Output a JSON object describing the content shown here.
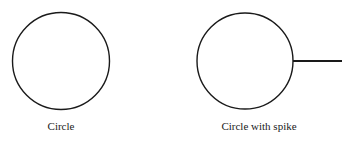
{
  "figures": [
    {
      "label": "Circle",
      "shape": "circle",
      "center": [
        61,
        61
      ],
      "radius": 48.5
    },
    {
      "label": "Circle with spike",
      "shape": "circle-with-spike",
      "center": [
        245,
        61
      ],
      "radius": 48,
      "spike": {
        "x1": 293,
        "y1": 61,
        "x2": 342,
        "y2": 61
      }
    }
  ],
  "colors": {
    "stroke": "#1a1a1a",
    "background": "#ffffff"
  }
}
